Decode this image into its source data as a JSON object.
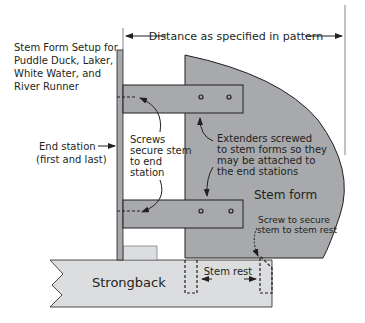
{
  "title": {
    "lines": [
      "Stem Form Setup for",
      "Puddle Duck, Laker,",
      "White Water, and",
      "River Runner"
    ]
  },
  "labels": {
    "distance": "Distance as specified in pattern",
    "end_station": [
      "End station",
      "(first and last)"
    ],
    "screws": [
      "Screws",
      "secure stem",
      "to end",
      "station"
    ],
    "extenders": [
      "Extenders screwed",
      "to stem forms so they",
      "may be attached to",
      "the end stations"
    ],
    "stem_form": "Stem form",
    "screw_rest": [
      "Screw to secure",
      "stem to stem rest"
    ],
    "stem_rest": "Stem rest",
    "strongback": "Strongback"
  },
  "colors": {
    "stem_form_fill": "#a7a9ac",
    "extender_fill": "#a7a9ac",
    "end_station_fill": "#a7a9ac",
    "strongback_fill": "#dcddde",
    "small_block_fill": "#dcddde",
    "stroke": "#231f20"
  }
}
